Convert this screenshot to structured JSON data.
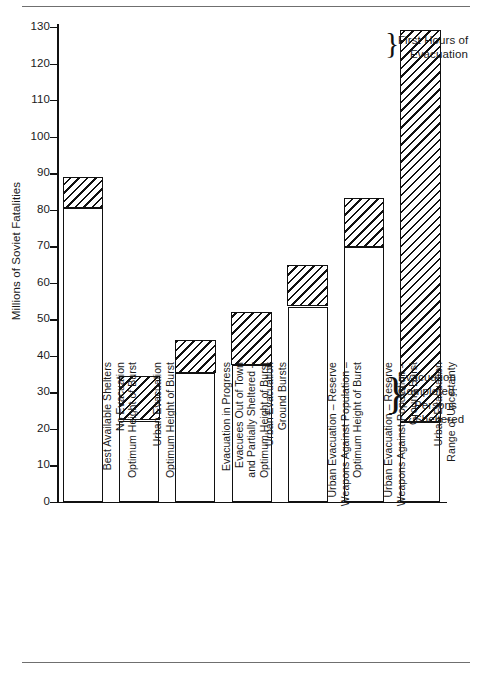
{
  "figure": {
    "y_axis_title": "Millions of Soviet Fatalities",
    "top_rule": true,
    "bottom_rule": true
  },
  "annotations": [
    {
      "id": "first-hours",
      "lines": [
        "First Hours of",
        "Evacuation"
      ]
    },
    {
      "id": "evacuation-completed",
      "lines": [
        "Evacuation",
        "Completed;",
        "Persons",
        "Sheltered"
      ]
    }
  ],
  "legend": {
    "hatched_meaning": "First Hours of Evacuation",
    "white_meaning": "Evacuation Completed; Persons Sheltered"
  },
  "chart_data": {
    "type": "bar",
    "title": "",
    "xlabel": "",
    "ylabel": "Millions of Soviet Fatalities",
    "ylim": [
      0,
      133
    ],
    "yticks": [
      0,
      10,
      20,
      30,
      40,
      50,
      60,
      70,
      80,
      90,
      100,
      110,
      120,
      130
    ],
    "ytick_labels": [
      "0",
      "10",
      "20",
      "30",
      "40",
      "50",
      "60",
      "70",
      "80",
      "90",
      "100",
      "110",
      "120",
      "130"
    ],
    "grid": false,
    "legend_position": "right-annotations",
    "stacked": true,
    "categories": [
      "Best Available Shelters\nNo Evacuation\nOptimum Height of Burst",
      "Urban Evacuation\nOptimum Height of Burst",
      "Evacuation in Progress\nEvacuees Out of Town\nand Partially Sheltered –\nOptimum Height of Burst",
      "Urban Evacuation\nGround Bursts",
      "Urban Evacuation – Reserve\nWeapons Against Population –\nOptimum Height of Burst",
      "Urban Evacuation – Reserve\nWeapons Against Population –\nGround Burst",
      "Urban Evacuation\nRange of Uncertainty"
    ],
    "category_lines": [
      [
        "Best Available Shelters",
        "No Evacuation",
        "Optimum Height of Burst"
      ],
      [
        "Urban Evacuation",
        "Optimum Height of Burst"
      ],
      [
        "Evacuation in Progress",
        "Evacuees Out of Town",
        "and Partially Sheltered –",
        "Optimum Height of Burst"
      ],
      [
        "Urban Evacuation",
        "Ground Bursts"
      ],
      [
        "Urban Evacuation – Reserve",
        "Weapons Against Population –",
        "Optimum Height of Burst"
      ],
      [
        "Urban Evacuation – Reserve",
        "Weapons Against Population –",
        "Ground Burst"
      ],
      [
        "Urban Evacuation",
        "Range of Uncertainty"
      ]
    ],
    "series": [
      {
        "name": "Evacuation Completed; Persons Sheltered",
        "fill": "white",
        "values": [
          80.5,
          22.3,
          35.3,
          37.5,
          53.5,
          69.8,
          21.8
        ]
      },
      {
        "name": "First Hours of Evacuation",
        "fill": "hatched",
        "values": [
          8.3,
          12.0,
          9.0,
          14.3,
          11.3,
          13.2,
          107.2
        ]
      }
    ],
    "totals": [
      88.8,
      34.3,
      44.3,
      51.8,
      64.8,
      83.0,
      129.0
    ]
  }
}
